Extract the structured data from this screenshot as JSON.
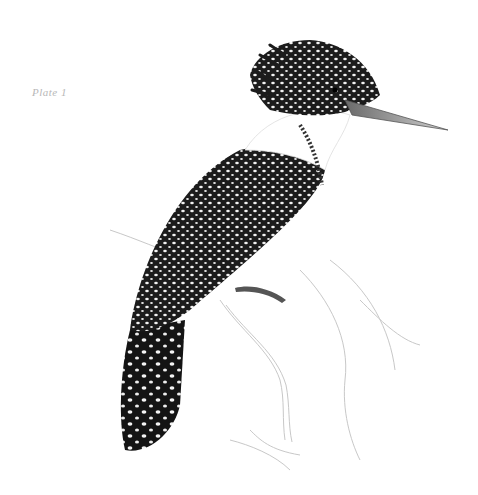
{
  "plate": {
    "label": "Plate 1"
  },
  "illustration": {
    "subject": "crested kingfisher",
    "style": "monochrome engraving",
    "colors": {
      "background": "#ffffff",
      "ink": "#1a1a1a",
      "spots": "#f2f2f2",
      "sketch": "#c8c8c8",
      "beak": "#9a9a9a"
    }
  }
}
